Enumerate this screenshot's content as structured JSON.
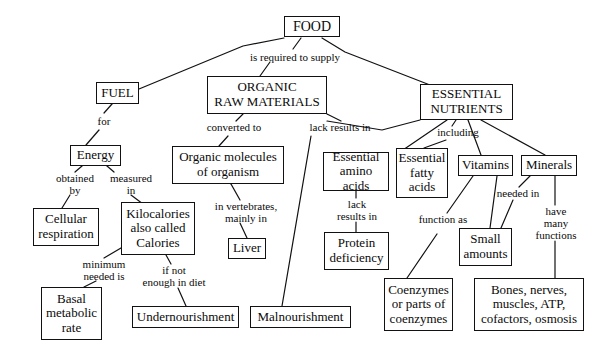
{
  "diagram": {
    "type": "concept-map",
    "stroke_color": "#111111",
    "background_color": "#ffffff",
    "text_color": "#0a0a0a"
  },
  "nodes": {
    "food": {
      "label": "FOOD",
      "x": 284,
      "y": 16,
      "w": 56,
      "h": 21,
      "fs": 14
    },
    "fuel": {
      "label": "FUEL",
      "x": 96,
      "y": 82,
      "w": 43,
      "h": 22,
      "fs": 13
    },
    "organic_raw": {
      "label": "ORGANIC\nRAW MATERIALS",
      "x": 207,
      "y": 76,
      "w": 120,
      "h": 38,
      "fs": 13
    },
    "essential_nutr": {
      "label": "ESSENTIAL\nNUTRIENTS",
      "x": 420,
      "y": 84,
      "w": 93,
      "h": 36,
      "fs": 13
    },
    "energy": {
      "label": "Energy",
      "x": 70,
      "y": 145,
      "w": 51,
      "h": 21,
      "fs": 13
    },
    "organic_mol": {
      "label": "Organic molecules\nof organism",
      "x": 172,
      "y": 146,
      "w": 112,
      "h": 38,
      "fs": 13
    },
    "ess_amino": {
      "label": "Essential\namino acids",
      "x": 323,
      "y": 152,
      "w": 66,
      "h": 39,
      "fs": 13
    },
    "ess_fatty": {
      "label": "Essential\nfatty\nacids",
      "x": 396,
      "y": 148,
      "w": 52,
      "h": 50,
      "fs": 13
    },
    "vitamins": {
      "label": "Vitamins",
      "x": 458,
      "y": 155,
      "w": 55,
      "h": 21,
      "fs": 13
    },
    "minerals": {
      "label": "Minerals",
      "x": 521,
      "y": 155,
      "w": 56,
      "h": 21,
      "fs": 13
    },
    "cellular_resp": {
      "label": "Cellular\nrespiration",
      "x": 33,
      "y": 208,
      "w": 66,
      "h": 38,
      "fs": 13
    },
    "kilocalories": {
      "label": "Kilocalories\nalso called\nCalories",
      "x": 121,
      "y": 202,
      "w": 74,
      "h": 53,
      "fs": 13
    },
    "liver": {
      "label": "Liver",
      "x": 228,
      "y": 238,
      "w": 38,
      "h": 21,
      "fs": 13
    },
    "protein_def": {
      "label": "Protein\ndeficiency",
      "x": 324,
      "y": 232,
      "w": 65,
      "h": 38,
      "fs": 13
    },
    "small_amounts": {
      "label": "Small\namounts",
      "x": 459,
      "y": 228,
      "w": 53,
      "h": 38,
      "fs": 13
    },
    "basal_metab": {
      "label": "Basal\nmetabolic\nrate",
      "x": 41,
      "y": 287,
      "w": 61,
      "h": 53,
      "fs": 13
    },
    "undernourish": {
      "label": "Undernourishment",
      "x": 132,
      "y": 306,
      "w": 107,
      "h": 22,
      "fs": 13
    },
    "malnourishment": {
      "label": "Malnourishment",
      "x": 250,
      "y": 306,
      "w": 101,
      "h": 22,
      "fs": 13
    },
    "coenzymes": {
      "label": "Coenzymes\nor parts of\ncoenzymes",
      "x": 384,
      "y": 278,
      "w": 69,
      "h": 53,
      "fs": 13
    },
    "bones": {
      "label": "Bones, nerves,\nmuscles, ATP,\ncofactors, osmosis",
      "x": 474,
      "y": 278,
      "w": 110,
      "h": 53,
      "fs": 13
    }
  },
  "link_labels": {
    "is_required_to_supply": {
      "text": "is required to supply",
      "x": 230,
      "y": 51,
      "w": 130,
      "fs": 11
    },
    "for": {
      "text": "for",
      "x": 91,
      "y": 115,
      "w": 26,
      "fs": 11
    },
    "converted_to": {
      "text": "converted to",
      "x": 197,
      "y": 121,
      "w": 74,
      "fs": 11
    },
    "lack_results_in_top": {
      "text": "lack results in",
      "x": 300,
      "y": 121,
      "w": 80,
      "fs": 11
    },
    "including": {
      "text": "including",
      "x": 430,
      "y": 126,
      "w": 56,
      "fs": 11
    },
    "obtained_by": {
      "text": "obtained\nby",
      "x": 47,
      "y": 172,
      "w": 56,
      "fs": 11
    },
    "measured_in": {
      "text": "measured\nin",
      "x": 103,
      "y": 172,
      "w": 56,
      "fs": 11
    },
    "in_vertebrates": {
      "text": "in vertebrates,\nmainly in",
      "x": 203,
      "y": 200,
      "w": 86,
      "fs": 11
    },
    "lack_results_in_2": {
      "text": "lack\nresults in",
      "x": 328,
      "y": 198,
      "w": 58,
      "fs": 11
    },
    "function_as": {
      "text": "function as",
      "x": 410,
      "y": 213,
      "w": 66,
      "fs": 11
    },
    "needed_in": {
      "text": "needed in",
      "x": 489,
      "y": 187,
      "w": 58,
      "fs": 11
    },
    "have_many_functions": {
      "text": "have\nmany\nfunctions",
      "x": 525,
      "y": 205,
      "w": 62,
      "fs": 11
    },
    "minimum_needed_is": {
      "text": "minimum\nneeded is",
      "x": 68,
      "y": 258,
      "w": 72,
      "fs": 11
    },
    "if_not_enough": {
      "text": "if not\nenough in diet",
      "x": 131,
      "y": 264,
      "w": 86,
      "fs": 11
    }
  },
  "edges": [
    {
      "from": "food",
      "to": "fuel",
      "name": "food-to-fuel"
    },
    {
      "from": "food",
      "to": "organic_raw",
      "name": "food-to-organic-raw-materials"
    },
    {
      "from": "food",
      "to": "essential_nutr",
      "name": "food-to-essential-nutrients"
    },
    {
      "from": "fuel",
      "to": "energy",
      "name": "fuel-to-energy"
    },
    {
      "from": "organic_raw",
      "to": "organic_mol",
      "name": "organic-raw-materials-to-organic-molecules"
    },
    {
      "from": "organic_raw",
      "to": "malnourishment",
      "name": "organic-raw-materials-to-malnourishment"
    },
    {
      "from": "essential_nutr",
      "to": "ess_amino",
      "name": "essential-nutrients-to-essential-amino-acids"
    },
    {
      "from": "essential_nutr",
      "to": "ess_fatty",
      "name": "essential-nutrients-to-essential-fatty-acids"
    },
    {
      "from": "essential_nutr",
      "to": "vitamins",
      "name": "essential-nutrients-to-vitamins"
    },
    {
      "from": "essential_nutr",
      "to": "minerals",
      "name": "essential-nutrients-to-minerals"
    },
    {
      "from": "energy",
      "to": "cellular_resp",
      "name": "energy-to-cellular-respiration"
    },
    {
      "from": "energy",
      "to": "kilocalories",
      "name": "energy-to-kilocalories"
    },
    {
      "from": "organic_mol",
      "to": "liver",
      "name": "organic-molecules-to-liver"
    },
    {
      "from": "ess_amino",
      "to": "protein_def",
      "name": "essential-amino-acids-to-protein-deficiency"
    },
    {
      "from": "vitamins",
      "to": "coenzymes",
      "name": "vitamins-to-coenzymes"
    },
    {
      "from": "vitamins",
      "to": "small_amounts",
      "name": "vitamins-to-small-amounts"
    },
    {
      "from": "minerals",
      "to": "small_amounts",
      "name": "minerals-to-small-amounts"
    },
    {
      "from": "minerals",
      "to": "bones",
      "name": "minerals-to-bones-nerves-muscles"
    },
    {
      "from": "kilocalories",
      "to": "basal_metab",
      "name": "kilocalories-to-basal-metabolic-rate"
    },
    {
      "from": "kilocalories",
      "to": "undernourish",
      "name": "kilocalories-to-undernourishment"
    }
  ],
  "edge_paths": [
    {
      "name": "food-to-fuel",
      "pts": "284,38 243,46 139,89"
    },
    {
      "name": "food-to-organic-raw-materials",
      "pts": "301,38 293,49"
    },
    {
      "name": "food-to-organic-raw-materials-2",
      "pts": "270,62 260,76"
    },
    {
      "name": "food-to-essential-nutrients",
      "pts": "322,38 345,52 430,85"
    },
    {
      "name": "fuel-to-energy",
      "pts": "112,104 104,113"
    },
    {
      "name": "fuel-to-energy-2",
      "pts": "99,130 86,145"
    },
    {
      "name": "organic-raw-materials-to-organic-molecules",
      "pts": "243,114 236,121"
    },
    {
      "name": "organic-raw-materials-to-organic-molecules-2",
      "pts": "228,136 219,146"
    },
    {
      "name": "organic-raw-materials-to-malnourishment",
      "pts": "327,114 341,121"
    },
    {
      "name": "lack-results-in-down-to-malnourishment",
      "pts": "311,136 282,306"
    },
    {
      "name": "essential-nutrients-to-ess-amino-label",
      "pts": "420,120 382,130 327,121"
    },
    {
      "name": "essential-nutrients-to-ess-amino-2",
      "pts": "447,120 400,152"
    },
    {
      "name": "essential-nutrients-to-including",
      "pts": "456,120 452,126"
    },
    {
      "name": "including-to-ess-fatty",
      "pts": "446,140 424,148"
    },
    {
      "name": "essential-nutrients-to-vitamins",
      "pts": "468,120 481,155"
    },
    {
      "name": "essential-nutrients-to-minerals",
      "pts": "481,120 545,155"
    },
    {
      "name": "energy-to-obtained-by",
      "pts": "82,166 75,172"
    },
    {
      "name": "obtained-by-to-cellular-resp",
      "pts": "70,195 62,208"
    },
    {
      "name": "energy-to-measured-in",
      "pts": "107,166 114,172"
    },
    {
      "name": "measured-in-to-kilocalories",
      "pts": "131,195 151,210"
    },
    {
      "name": "organic-molecules-to-in-vertebrates",
      "pts": "231,184 240,200"
    },
    {
      "name": "in-vertebrates-to-liver",
      "pts": "240,223 247,238"
    },
    {
      "name": "ess-amino-to-lack-results",
      "pts": "356,191 356,198"
    },
    {
      "name": "lack-results-to-protein-def",
      "pts": "356,222 356,232"
    },
    {
      "name": "vitamins-to-function-as",
      "pts": "473,176 447,213"
    },
    {
      "name": "function-as-to-coenzymes",
      "pts": "437,234 407,278"
    },
    {
      "name": "vitamins-to-small-amounts",
      "pts": "497,176 490,228"
    },
    {
      "name": "minerals-to-needed-in",
      "pts": "530,176 519,187"
    },
    {
      "name": "needed-in-to-small-amounts",
      "pts": "513,200 501,228"
    },
    {
      "name": "minerals-to-have-many",
      "pts": "555,176 555,205"
    },
    {
      "name": "have-many-to-bones",
      "pts": "555,241 555,278"
    },
    {
      "name": "kilocalories-to-minimum-needed",
      "pts": "121,248 104,258"
    },
    {
      "name": "minimum-needed-to-basal",
      "pts": "96,281 84,287"
    },
    {
      "name": "kilocalories-to-if-not-enough",
      "pts": "166,255 171,264"
    },
    {
      "name": "if-not-enough-to-undernourish",
      "pts": "178,288 186,306"
    }
  ]
}
